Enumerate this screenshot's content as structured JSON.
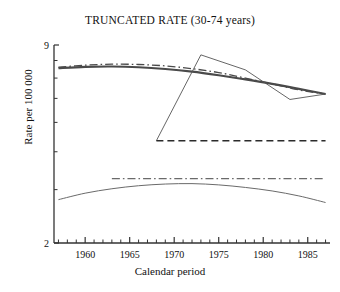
{
  "chart_data": {
    "type": "line",
    "title": "TRUNCATED RATE (30-74 years)",
    "xlabel": "Calendar period",
    "ylabel": "Rate per 100 000",
    "xlim": [
      1956.5,
      1987.5
    ],
    "ylim": [
      2,
      9
    ],
    "yscale": "log",
    "grid": false,
    "legend": null,
    "ytick_labels": [
      "9",
      "2"
    ],
    "ytick_values": [
      9,
      2
    ],
    "yminor_ticks": [
      8,
      7,
      6,
      5,
      4,
      3
    ],
    "xtick_labels": [
      "1960",
      "1965",
      "1970",
      "1975",
      "1980",
      "1985"
    ],
    "xtick_values": [
      1960,
      1965,
      1970,
      1975,
      1980,
      1985
    ],
    "xminor_tick_step": 1,
    "series": [
      {
        "name": "observed-rate-thick",
        "style": "solid",
        "width": 2.1,
        "color": "#4a4a4a",
        "x": [
          1957,
          1960,
          1963,
          1966,
          1969,
          1972,
          1975,
          1978,
          1981,
          1984,
          1987
        ],
        "y": [
          7.55,
          7.62,
          7.64,
          7.6,
          7.5,
          7.35,
          7.15,
          6.93,
          6.7,
          6.45,
          6.2
        ]
      },
      {
        "name": "fitted-rate-dashdot",
        "style": "dashdot",
        "width": 1.3,
        "color": "#4a4a4a",
        "x": [
          1957,
          1960,
          1963,
          1966,
          1969,
          1972,
          1975,
          1978,
          1981,
          1984,
          1987
        ],
        "y": [
          7.6,
          7.72,
          7.78,
          7.76,
          7.68,
          7.52,
          7.3,
          7.0,
          6.7,
          6.4,
          6.2
        ]
      },
      {
        "name": "cohort-rate-thin",
        "style": "solid",
        "width": 0.9,
        "color": "#555555",
        "x": [
          1968,
          1973,
          1978,
          1983,
          1987
        ],
        "y": [
          4.35,
          8.35,
          7.45,
          5.95,
          6.2
        ]
      },
      {
        "name": "reference-level-dashed",
        "style": "dashed",
        "width": 1.4,
        "color": "#2b2b2b",
        "x": [
          1968,
          1987
        ],
        "y": [
          4.35,
          4.35
        ]
      },
      {
        "name": "lower-level-dashdot",
        "style": "dashdot",
        "width": 1.2,
        "color": "#6a6a6a",
        "x": [
          1963,
          1987
        ],
        "y": [
          3.26,
          3.26
        ]
      },
      {
        "name": "lower-rate-arc",
        "style": "solid",
        "width": 1.0,
        "color": "#6a6a6a",
        "x": [
          1957,
          1960,
          1963,
          1966,
          1969,
          1972,
          1975,
          1978,
          1981,
          1984,
          1987
        ],
        "y": [
          2.78,
          2.92,
          3.02,
          3.09,
          3.13,
          3.14,
          3.11,
          3.05,
          2.97,
          2.86,
          2.72
        ]
      }
    ]
  }
}
